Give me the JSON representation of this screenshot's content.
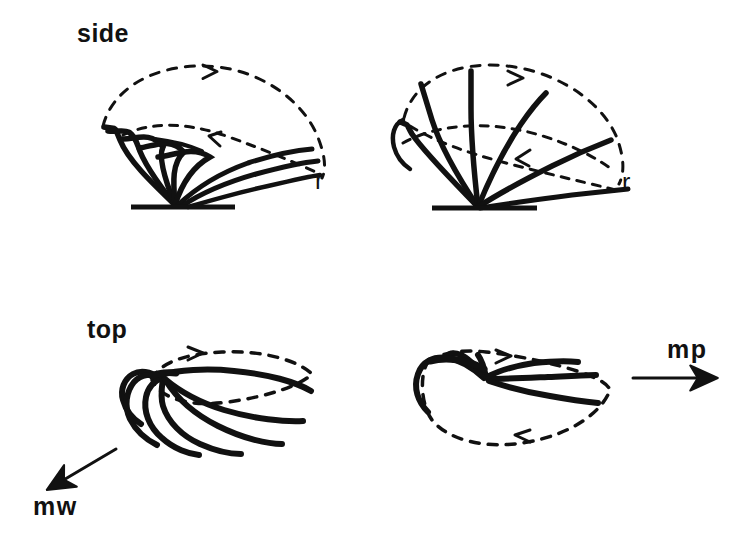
{
  "figure": {
    "background_color": "#ffffff",
    "ink_color": "#111111",
    "width": 754,
    "height": 538
  },
  "labels": {
    "side_view": "side",
    "top_view": "top",
    "r_left": "r",
    "r_right": "r",
    "mw": "mw",
    "mp": "mp"
  },
  "panels": [
    {
      "id": "side-left",
      "view": "side",
      "view_label": "side",
      "axis_label": "r",
      "stroke_count": 5,
      "has_baseline": true,
      "has_dashed_outline": true,
      "arrow_count": 2
    },
    {
      "id": "side-right",
      "view": "side",
      "view_label": "",
      "axis_label": "r",
      "stroke_count": 6,
      "has_baseline": true,
      "has_dashed_outline": true,
      "arrow_count": 2
    },
    {
      "id": "top-left",
      "view": "top",
      "view_label": "top",
      "axis_label": "mw",
      "stroke_count": 5,
      "has_baseline": false,
      "has_dashed_outline": true,
      "arrow_count": 1
    },
    {
      "id": "top-right",
      "view": "top",
      "view_label": "",
      "axis_label": "mp",
      "stroke_count": 5,
      "has_baseline": false,
      "has_dashed_outline": true,
      "arrow_count": 2
    }
  ],
  "vectors": [
    {
      "name": "mw",
      "label": "mw",
      "direction": "down-left",
      "x1": 116,
      "y1": 449,
      "x2": 46,
      "y2": 491
    },
    {
      "name": "mp",
      "label": "mp",
      "direction": "right",
      "x1": 633,
      "y1": 378,
      "x2": 722,
      "y2": 378
    }
  ]
}
